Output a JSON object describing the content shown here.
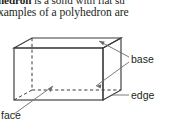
{
  "body_text": {
    "line1_bold": "hedron",
    "line1_rest": " is a solid with flat su",
    "line2": "xamples of a polyhedron are"
  },
  "figure": {
    "shape_name": "rectangular-prism",
    "labels": {
      "base": "base",
      "edge": "edge",
      "face": "face"
    },
    "colors": {
      "line": "#3b3b3b",
      "leader": "#6b6b6b",
      "text": "#231f20",
      "background": "#ffffff"
    }
  }
}
